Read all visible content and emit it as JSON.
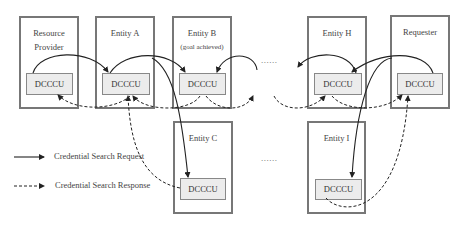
{
  "entities": [
    {
      "id": "resource-provider",
      "title_line1": "Resource",
      "title_line2": "Provider",
      "unit": "DCCCU"
    },
    {
      "id": "entity-a",
      "title": "Entity A",
      "unit": "DCCCU"
    },
    {
      "id": "entity-b",
      "title": "Entity B",
      "subtitle": "(goal achieved)",
      "unit": "DCCCU"
    },
    {
      "id": "entity-c",
      "title": "Entity C",
      "unit": "DCCCU"
    },
    {
      "id": "entity-h",
      "title": "Entity H",
      "unit": "DCCCU"
    },
    {
      "id": "requester",
      "title": "Requester",
      "unit": "DCCCU"
    },
    {
      "id": "entity-i",
      "title": "Entity I",
      "unit": "DCCCU"
    }
  ],
  "ellipsis_top": "......",
  "ellipsis_bottom": "......",
  "legend": {
    "request": "Credential Search Request",
    "response": "Credential Search Response"
  },
  "colors": {
    "line": "#222222",
    "box_border": "#777777",
    "unit_fill": "#ececec"
  }
}
